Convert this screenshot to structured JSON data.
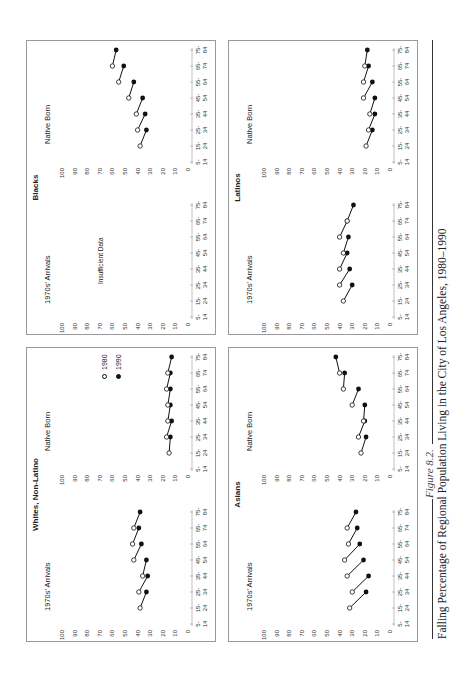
{
  "figure": {
    "label": "Figure 8.2.",
    "caption": "Falling Percentage of Regional Population Living in the City of Los Angeles, 1980–1990"
  },
  "legend": {
    "items": [
      {
        "label": "1980",
        "marker": "open-circle"
      },
      {
        "label": "1990",
        "marker": "filled-circle"
      }
    ]
  },
  "panels": {
    "whites": {
      "title": "Whites, Non-Latino",
      "arrivals_label": "1970s' Arrivals",
      "native_label": "Native Born"
    },
    "asians": {
      "title": "Asians",
      "arrivals_label": "1970s' Arrivals",
      "native_label": "Native Born"
    },
    "blacks": {
      "title": "Blacks",
      "arrivals_label": "1970s' Arrivals",
      "native_label": "Native Born",
      "arrivals_note": "Insufficient Data"
    },
    "latinos": {
      "title": "Latinos",
      "arrivals_label": "1970s' Arrivals",
      "native_label": "Native Born"
    }
  },
  "axis": {
    "y_ticks": [
      "0",
      "10",
      "20",
      "30",
      "40",
      "50",
      "60",
      "70",
      "80",
      "90",
      "100"
    ],
    "x_ticks_top": [
      "5-",
      "15-",
      "25-",
      "35-",
      "45-",
      "55-",
      "65-",
      "75-"
    ],
    "x_ticks_bottom": [
      "14",
      "24",
      "34",
      "44",
      "54",
      "64",
      "74",
      "84"
    ]
  },
  "chart_data": [
    {
      "type": "line",
      "title": "Whites, Non-Latino — 1970s' Arrivals",
      "xlabel": "Age group",
      "ylabel": "Percent living in City of Los Angeles",
      "ylim": [
        0,
        100
      ],
      "categories": [
        "5-14",
        "15-24",
        "25-34",
        "35-44",
        "45-54",
        "55-64",
        "65-74",
        "75-84"
      ],
      "cohorts": [
        {
          "from": "15-24",
          "to": "25-34",
          "v1980": 38,
          "v1990": 33
        },
        {
          "from": "25-34",
          "to": "35-44",
          "v1980": 39,
          "v1990": 32
        },
        {
          "from": "35-44",
          "to": "45-54",
          "v1980": 36,
          "v1990": 33
        },
        {
          "from": "45-54",
          "to": "55-64",
          "v1980": 43,
          "v1990": 37
        },
        {
          "from": "55-64",
          "to": "65-74",
          "v1980": 44,
          "v1990": 39
        },
        {
          "from": "65-74",
          "to": "75-84",
          "v1980": 43,
          "v1990": 38
        }
      ]
    },
    {
      "type": "line",
      "title": "Whites, Non-Latino — Native Born",
      "ylim": [
        0,
        100
      ],
      "categories": [
        "5-14",
        "15-24",
        "25-34",
        "35-44",
        "45-54",
        "55-64",
        "65-74",
        "75-84"
      ],
      "cohorts": [
        {
          "from": "15-24",
          "to": "25-34",
          "v1980": 15,
          "v1990": 14
        },
        {
          "from": "25-34",
          "to": "35-44",
          "v1980": 17,
          "v1990": 13
        },
        {
          "from": "35-44",
          "to": "45-54",
          "v1980": 16,
          "v1990": 14
        },
        {
          "from": "45-54",
          "to": "55-64",
          "v1980": 16,
          "v1990": 14
        },
        {
          "from": "55-64",
          "to": "65-74",
          "v1980": 17,
          "v1990": 14
        },
        {
          "from": "65-74",
          "to": "75-84",
          "v1980": 16,
          "v1990": 13
        }
      ]
    },
    {
      "type": "line",
      "title": "Asians — 1970s' Arrivals",
      "ylim": [
        0,
        100
      ],
      "categories": [
        "5-14",
        "15-24",
        "25-34",
        "35-44",
        "45-54",
        "55-64",
        "65-74",
        "75-84"
      ],
      "cohorts": [
        {
          "from": "15-24",
          "to": "25-34",
          "v1980": 32,
          "v1990": 19
        },
        {
          "from": "25-34",
          "to": "35-44",
          "v1980": 30,
          "v1990": 17
        },
        {
          "from": "35-44",
          "to": "45-54",
          "v1980": 34,
          "v1990": 21
        },
        {
          "from": "45-54",
          "to": "55-64",
          "v1980": 36,
          "v1990": 24
        },
        {
          "from": "55-64",
          "to": "65-74",
          "v1980": 33,
          "v1990": 26
        },
        {
          "from": "65-74",
          "to": "75-84",
          "v1980": 34,
          "v1990": 27
        }
      ]
    },
    {
      "type": "line",
      "title": "Asians — Native Born",
      "ylim": [
        0,
        100
      ],
      "categories": [
        "5-14",
        "15-24",
        "25-34",
        "35-44",
        "45-54",
        "55-64",
        "65-74",
        "75-84"
      ],
      "cohorts": [
        {
          "from": "15-24",
          "to": "25-34",
          "v1980": 23,
          "v1990": 19
        },
        {
          "from": "25-34",
          "to": "35-44",
          "v1980": 25,
          "v1990": 20
        },
        {
          "from": "35-44",
          "to": "45-54",
          "v1980": 21,
          "v1990": 20
        },
        {
          "from": "45-54",
          "to": "55-64",
          "v1980": 30,
          "v1990": 25
        },
        {
          "from": "55-64",
          "to": "65-74",
          "v1980": 37,
          "v1990": 36
        },
        {
          "from": "65-74",
          "to": "75-84",
          "v1980": 40,
          "v1990": 43
        }
      ]
    },
    {
      "type": "line",
      "title": "Blacks — 1970s' Arrivals",
      "ylim": [
        0,
        100
      ],
      "categories": [
        "5-14",
        "15-24",
        "25-34",
        "35-44",
        "45-54",
        "55-64",
        "65-74",
        "75-84"
      ],
      "annotations": [
        "Insufficient Data"
      ],
      "cohorts": []
    },
    {
      "type": "line",
      "title": "Blacks — Native Born",
      "ylim": [
        0,
        100
      ],
      "categories": [
        "5-14",
        "15-24",
        "25-34",
        "35-44",
        "45-54",
        "55-64",
        "65-74",
        "75-84"
      ],
      "cohorts": [
        {
          "from": "15-24",
          "to": "25-34",
          "v1980": 38,
          "v1990": 33
        },
        {
          "from": "25-34",
          "to": "35-44",
          "v1980": 40,
          "v1990": 34
        },
        {
          "from": "35-44",
          "to": "45-54",
          "v1980": 41,
          "v1990": 36
        },
        {
          "from": "45-54",
          "to": "55-64",
          "v1980": 47,
          "v1990": 43
        },
        {
          "from": "55-64",
          "to": "65-74",
          "v1980": 55,
          "v1990": 51
        },
        {
          "from": "65-74",
          "to": "75-84",
          "v1980": 60,
          "v1990": 57
        }
      ]
    },
    {
      "type": "line",
      "title": "Latinos — 1970s' Arrivals",
      "ylim": [
        0,
        100
      ],
      "categories": [
        "5-14",
        "15-24",
        "25-34",
        "35-44",
        "45-54",
        "55-64",
        "65-74",
        "75-84"
      ],
      "cohorts": [
        {
          "from": "15-24",
          "to": "25-34",
          "v1980": 37,
          "v1990": 30
        },
        {
          "from": "25-34",
          "to": "35-44",
          "v1980": 40,
          "v1990": 32
        },
        {
          "from": "35-44",
          "to": "45-54",
          "v1980": 40,
          "v1990": 34
        },
        {
          "from": "45-54",
          "to": "55-64",
          "v1980": 37,
          "v1990": 33
        },
        {
          "from": "55-64",
          "to": "65-74",
          "v1980": 40,
          "v1990": 34
        },
        {
          "from": "65-74",
          "to": "75-84",
          "v1980": 34,
          "v1990": 29
        }
      ]
    },
    {
      "type": "line",
      "title": "Latinos — Native Born",
      "ylim": [
        0,
        100
      ],
      "categories": [
        "5-14",
        "15-24",
        "25-34",
        "35-44",
        "45-54",
        "55-64",
        "65-74",
        "75-84"
      ],
      "cohorts": [
        {
          "from": "15-24",
          "to": "25-34",
          "v1980": 19,
          "v1990": 14
        },
        {
          "from": "25-34",
          "to": "35-44",
          "v1980": 17,
          "v1990": 12
        },
        {
          "from": "35-44",
          "to": "45-54",
          "v1980": 16,
          "v1990": 12
        },
        {
          "from": "45-54",
          "to": "55-64",
          "v1980": 21,
          "v1990": 14
        },
        {
          "from": "55-64",
          "to": "65-74",
          "v1980": 21,
          "v1990": 17
        },
        {
          "from": "65-74",
          "to": "75-84",
          "v1980": 20,
          "v1990": 18
        }
      ]
    }
  ]
}
